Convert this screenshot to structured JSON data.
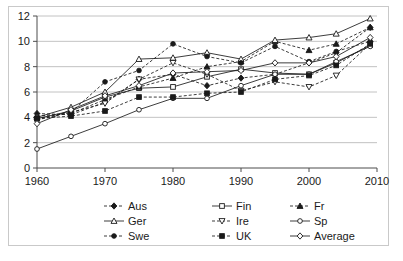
{
  "chart_data": {
    "type": "line",
    "title": "",
    "subtitle": "",
    "xlabel": "",
    "ylabel": "",
    "xlim": [
      1960,
      2010
    ],
    "ylim": [
      0,
      12
    ],
    "xticks": [
      "1960",
      "1970",
      "1980",
      "1990",
      "2000",
      "2010"
    ],
    "yticks": [
      "0",
      "2",
      "4",
      "6",
      "8",
      "10",
      "12"
    ],
    "grid": "horizontal",
    "legend_position": "bottom",
    "legend_columns": 3,
    "x": [
      1960,
      1965,
      1970,
      1975,
      1980,
      1985,
      1990,
      1995,
      2000,
      2004,
      2009
    ],
    "series": [
      {
        "name": "Aus",
        "marker": "filled-diamond",
        "line": "dashed",
        "values": [
          4.3,
          4.2,
          5.2,
          7.0,
          7.4,
          6.5,
          7.1,
          7.4,
          8.3,
          9.1,
          11.1
        ]
      },
      {
        "name": "Fin",
        "marker": "open-square",
        "line": "solid",
        "values": [
          3.9,
          4.5,
          5.6,
          6.3,
          6.4,
          7.2,
          7.8,
          7.5,
          7.4,
          8.3,
          9.7
        ]
      },
      {
        "name": "Fr",
        "marker": "filled-triangle",
        "line": "dashed",
        "values": [
          4.1,
          4.3,
          5.4,
          6.4,
          7.1,
          8.0,
          8.4,
          10.0,
          9.3,
          9.8,
          11.1
        ]
      },
      {
        "name": "Ger",
        "marker": "open-triangle",
        "line": "solid",
        "values": [
          4.0,
          4.8,
          6.0,
          8.6,
          8.7,
          9.1,
          8.6,
          10.1,
          10.3,
          10.6,
          11.8
        ]
      },
      {
        "name": "Ire",
        "marker": "open-inverted-triangle",
        "line": "dashed",
        "values": [
          3.8,
          4.4,
          5.1,
          7.0,
          8.3,
          7.4,
          6.1,
          6.8,
          6.4,
          7.3,
          9.8
        ]
      },
      {
        "name": "Sp",
        "marker": "open-circle",
        "line": "solid",
        "values": [
          1.5,
          2.5,
          3.5,
          4.6,
          5.5,
          5.5,
          6.5,
          7.4,
          7.4,
          8.4,
          9.6
        ]
      },
      {
        "name": "Swe",
        "marker": "filled-circle",
        "line": "dashed",
        "values": [
          3.9,
          4.4,
          6.8,
          7.7,
          9.8,
          8.8,
          8.3,
          9.6,
          8.4,
          9.2,
          10.0
        ]
      },
      {
        "name": "UK",
        "marker": "filled-square",
        "line": "dashed",
        "values": [
          3.9,
          4.1,
          4.5,
          5.6,
          5.6,
          5.9,
          6.0,
          7.0,
          7.3,
          8.1,
          9.8
        ]
      },
      {
        "name": "Average",
        "marker": "open-diamond",
        "line": "solid",
        "values": [
          3.5,
          4.6,
          5.7,
          6.5,
          7.5,
          7.6,
          7.7,
          8.3,
          8.3,
          8.8,
          10.3
        ]
      }
    ]
  },
  "legend": {
    "items": [
      {
        "label": "Aus"
      },
      {
        "label": "Fin"
      },
      {
        "label": "Fr"
      },
      {
        "label": "Ger"
      },
      {
        "label": "Ire"
      },
      {
        "label": "Sp"
      },
      {
        "label": "Swe"
      },
      {
        "label": "UK"
      },
      {
        "label": "Average"
      }
    ]
  },
  "colors": {
    "ink": "#1a1a1a",
    "grid": "#b3b3b3",
    "axis": "#4d4d4d",
    "border": "#c9c9c9",
    "background": "#ffffff"
  }
}
